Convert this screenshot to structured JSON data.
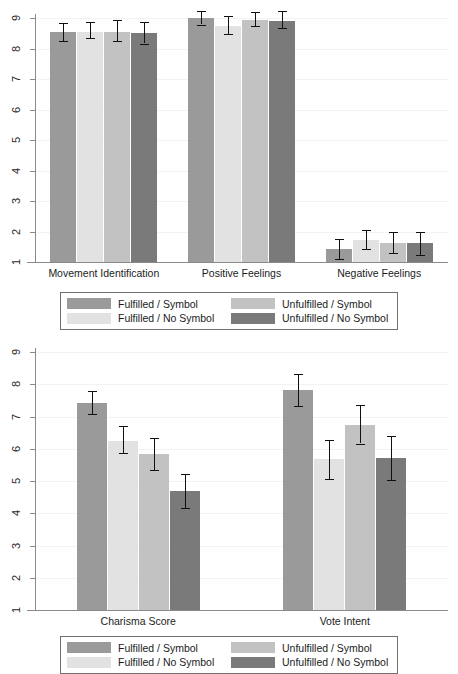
{
  "figure": {
    "background": "#ffffff",
    "series_colors": {
      "fulfilled_symbol": "#9a9a9a",
      "fulfilled_no_symbol": "#e2e2e2",
      "unfulfilled_symbol": "#c2c2c2",
      "unfulfilled_no_symbol": "#7a7a7a"
    },
    "axis_color": "#8a8a8a",
    "grid_color": "#f2f2f2",
    "error_bar_color": "#101010"
  },
  "legend": {
    "items": [
      {
        "label": "Fulfilled / Symbol",
        "color": "#9a9a9a",
        "swatch_name": "legend-swatch-fulfilled-symbol"
      },
      {
        "label": "Unfulfilled / Symbol",
        "color": "#c2c2c2",
        "swatch_name": "legend-swatch-unfulfilled-symbol"
      },
      {
        "label": "Fulfilled / No Symbol",
        "color": "#e2e2e2",
        "swatch_name": "legend-swatch-fulfilled-no-symbol"
      },
      {
        "label": "Unfulfilled / No Symbol",
        "color": "#7a7a7a",
        "swatch_name": "legend-swatch-unfulfilled-no-symbol"
      }
    ]
  },
  "chart_data": [
    {
      "id": "top",
      "type": "bar",
      "title": "",
      "subtitle": "",
      "xlabel": "",
      "ylabel": "",
      "ylim": [
        1,
        9
      ],
      "yticks": [
        1,
        2,
        3,
        4,
        5,
        6,
        7,
        8,
        9
      ],
      "ytick_labels": [
        "1",
        "2",
        "3",
        "4",
        "5",
        "6",
        "7",
        "8",
        "9"
      ],
      "grid": true,
      "grid_axis": "y",
      "legend_position": "below-axes",
      "error_bars": "95% CI",
      "categories": [
        "Movement Identification",
        "Positive Feelings",
        "Negative Feelings"
      ],
      "series": [
        {
          "name": "Fulfilled / Symbol",
          "color": "#9a9a9a",
          "values": [
            8.55,
            9.0,
            1.42
          ],
          "ci_low": [
            8.26,
            8.78,
            1.1
          ],
          "ci_high": [
            8.84,
            9.22,
            1.74
          ]
        },
        {
          "name": "Fulfilled / No Symbol",
          "color": "#e2e2e2",
          "values": [
            8.55,
            8.75,
            1.73
          ],
          "ci_low": [
            8.33,
            8.48,
            1.42
          ],
          "ci_high": [
            8.87,
            9.06,
            2.06
          ]
        },
        {
          "name": "Unfulfilled / Symbol",
          "color": "#c2c2c2",
          "values": [
            8.55,
            8.95,
            1.63
          ],
          "ci_low": [
            8.25,
            8.74,
            1.3
          ],
          "ci_high": [
            8.93,
            9.2,
            1.98
          ]
        },
        {
          "name": "Unfulfilled / No Symbol",
          "color": "#7a7a7a",
          "values": [
            8.5,
            8.9,
            1.63
          ],
          "ci_low": [
            8.16,
            8.66,
            1.24
          ],
          "ci_high": [
            8.86,
            9.22,
            2.0
          ]
        }
      ]
    },
    {
      "id": "bottom",
      "type": "bar",
      "title": "",
      "subtitle": "",
      "xlabel": "",
      "ylabel": "",
      "ylim": [
        1,
        9
      ],
      "yticks": [
        1,
        2,
        3,
        4,
        5,
        6,
        7,
        8,
        9
      ],
      "ytick_labels": [
        "1",
        "2",
        "3",
        "4",
        "5",
        "6",
        "7",
        "8",
        "9"
      ],
      "grid": true,
      "grid_axis": "y",
      "legend_position": "below-axes",
      "error_bars": "95% CI",
      "categories": [
        "Charisma Score",
        "Vote Intent"
      ],
      "series": [
        {
          "name": "Fulfilled / Symbol",
          "color": "#9a9a9a",
          "values": [
            7.42,
            7.83
          ],
          "ci_low": [
            7.07,
            7.33
          ],
          "ci_high": [
            7.79,
            8.31
          ]
        },
        {
          "name": "Fulfilled / No Symbol",
          "color": "#e2e2e2",
          "values": [
            6.25,
            5.67
          ],
          "ci_low": [
            5.87,
            5.05
          ],
          "ci_high": [
            6.7,
            6.27
          ]
        },
        {
          "name": "Unfulfilled / Symbol",
          "color": "#c2c2c2",
          "values": [
            5.85,
            6.75
          ],
          "ci_low": [
            5.33,
            6.16
          ],
          "ci_high": [
            6.34,
            7.35
          ]
        },
        {
          "name": "Unfulfilled / No Symbol",
          "color": "#7a7a7a",
          "values": [
            4.7,
            5.72
          ],
          "ci_low": [
            4.17,
            5.02
          ],
          "ci_high": [
            5.21,
            6.38
          ]
        }
      ]
    }
  ]
}
